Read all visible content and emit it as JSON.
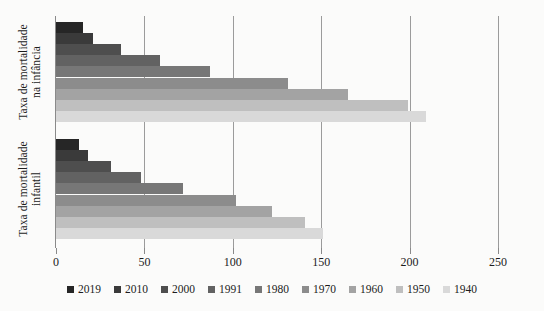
{
  "chart_data": {
    "type": "bar",
    "orientation": "horizontal",
    "title": "",
    "xlabel": "",
    "ylabel": "",
    "categories": [
      "Taxa de mortalidade\nna infância",
      "Taxa de mortalidade\ninfantil"
    ],
    "series": [
      {
        "name": "2019",
        "color": "#262626",
        "values": [
          15,
          13
        ]
      },
      {
        "name": "2010",
        "color": "#3a3a3a",
        "values": [
          21,
          18
        ]
      },
      {
        "name": "2000",
        "color": "#4e4e4e",
        "values": [
          37,
          31
        ]
      },
      {
        "name": "1991",
        "color": "#626262",
        "values": [
          59,
          48
        ]
      },
      {
        "name": "1980",
        "color": "#777777",
        "values": [
          87,
          72
        ]
      },
      {
        "name": "1970",
        "color": "#8c8c8c",
        "values": [
          131,
          102
        ]
      },
      {
        "name": "1960",
        "color": "#a3a3a3",
        "values": [
          165,
          122
        ]
      },
      {
        "name": "1950",
        "color": "#bfbfbf",
        "values": [
          199,
          141
        ]
      },
      {
        "name": "1940",
        "color": "#d9d9d9",
        "values": [
          209,
          151
        ]
      }
    ],
    "xlim": [
      0,
      250
    ],
    "xticks": [
      0,
      50,
      100,
      150,
      200,
      250
    ],
    "xtick_labels": [
      "0",
      "50",
      "100",
      "150",
      "200",
      "250"
    ],
    "grid": "vertical",
    "legend_position": "bottom",
    "axis_color": "#8a8a8a",
    "gridline_color": "#9b9b9b",
    "background_color": "#fbfbfa"
  }
}
